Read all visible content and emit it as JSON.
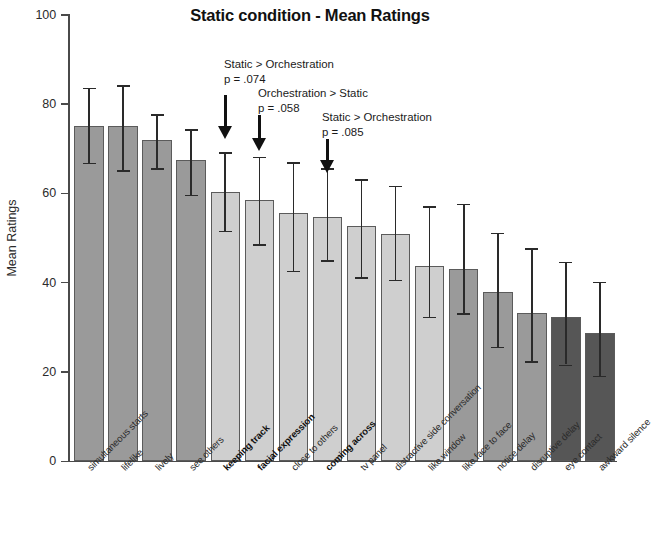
{
  "chart_data": {
    "type": "bar",
    "title": "Static condition - Mean Ratings",
    "xlabel": "",
    "ylabel": "Mean Ratings",
    "ylim": [
      0,
      100
    ],
    "yticks": [
      0,
      20,
      40,
      60,
      80,
      100
    ],
    "ytick_labels": [
      "0",
      "20",
      "40",
      "60",
      "80",
      "100"
    ],
    "grid": false,
    "legend": "none",
    "error_bar_type": "standard deviation",
    "categories": [
      "simultaneous starts",
      "lifelike",
      "lively",
      "see others",
      "keeping track",
      "facial expression",
      "close to others",
      "coming across",
      "tv panel",
      "distractive side conversation",
      "like window",
      "like face to face",
      "notice delay",
      "disruptive delay",
      "eye contact",
      "awkward silence"
    ],
    "category_emphasis": [
      false,
      false,
      false,
      false,
      true,
      true,
      false,
      true,
      false,
      false,
      false,
      false,
      false,
      false,
      false,
      false
    ],
    "values": [
      75.0,
      75.0,
      71.8,
      67.2,
      60.2,
      58.3,
      55.5,
      54.6,
      52.6,
      50.8,
      43.5,
      43.0,
      37.8,
      33.0,
      32.2,
      28.5
    ],
    "err_upper": [
      83.5,
      84.0,
      77.5,
      74.2,
      69.0,
      68.0,
      66.8,
      65.5,
      63.0,
      61.5,
      57.0,
      57.5,
      51.0,
      47.5,
      44.5,
      40.0
    ],
    "err_lower": [
      66.7,
      65.0,
      65.5,
      59.5,
      51.5,
      48.5,
      42.5,
      44.8,
      41.0,
      40.5,
      32.2,
      33.0,
      25.5,
      22.2,
      21.5,
      19.0
    ],
    "bar_shades": [
      "medium",
      "medium",
      "medium",
      "medium",
      "light",
      "light",
      "light",
      "light",
      "light",
      "light",
      "light",
      "medium",
      "medium",
      "medium",
      "dark",
      "dark"
    ],
    "colors": {
      "bar_medium": "#9a9a9a",
      "bar_light": "#cfcfcf",
      "bar_dark": "#565656",
      "bar_outline": "#5b5b5b",
      "error_bar": "#2a2a2a",
      "axis": "#4a4a4a",
      "text": "#1a1a1a"
    },
    "annotations": [
      {
        "id": "annotation-1",
        "line1": "Static > Orchestration",
        "line2": "p = .074",
        "target_category": "keeping track",
        "target_index": 4
      },
      {
        "id": "annotation-2",
        "line1": "Orchestration > Static",
        "line2": "p = .058",
        "target_category": "facial expression",
        "target_index": 5
      },
      {
        "id": "annotation-3",
        "line1": "Static > Orchestration",
        "line2": "p = .085",
        "target_category": "coming across",
        "target_index": 7
      }
    ]
  }
}
